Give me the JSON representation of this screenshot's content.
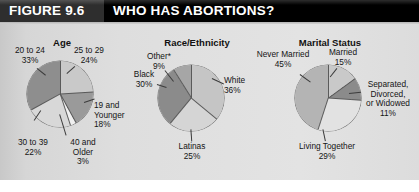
{
  "header": {
    "figure_number": "FIGURE 9.6",
    "title": "WHO HAS ABORTIONS?"
  },
  "chart_data": [
    {
      "type": "pie",
      "title": "Age",
      "categories": [
        "25 to 29",
        "19 and Younger",
        "40 and Older",
        "30 to 39",
        "20 to 24"
      ],
      "values": [
        24,
        18,
        3,
        22,
        33
      ],
      "labels": [
        "25 to 29\n24%",
        "19 and\nYounger\n18%",
        "40 and\nOlder\n3%",
        "30 to 39\n22%",
        "20 to 24\n33%"
      ],
      "colors": [
        "#c9c9c9",
        "#9a9a9a",
        "#f0f0f0",
        "#d8d8d8",
        "#8e8e8e"
      ],
      "legend": "none",
      "start_angle": 0,
      "direction": "clockwise"
    },
    {
      "type": "pie",
      "title": "Race/Ethnicity",
      "categories": [
        "White",
        "Latinas",
        "Black",
        "Other*"
      ],
      "values": [
        36,
        25,
        30,
        9
      ],
      "labels": [
        "White\n36%",
        "Latinas\n25%",
        "Black\n30%",
        "Other*\n9%"
      ],
      "colors": [
        "#c5c5c5",
        "#d5d5d5",
        "#8b8b8b",
        "#a6a6a6"
      ],
      "legend": "none",
      "start_angle": 0,
      "direction": "clockwise"
    },
    {
      "type": "pie",
      "title": "Marital Status",
      "categories": [
        "Married",
        "Separated, Divorced, or Widowed",
        "Living Together",
        "Never Married"
      ],
      "values": [
        15,
        11,
        29,
        45
      ],
      "labels": [
        "Married\n15%",
        "Separated,\nDivorced,\nor Widowed\n11%",
        "Living Together\n29%",
        "Never Married\n45%"
      ],
      "colors": [
        "#c9c9c9",
        "#8b8b8b",
        "#e2e2e2",
        "#b4b4b4"
      ],
      "legend": "none",
      "start_angle": 0,
      "direction": "clockwise"
    }
  ],
  "age_chart": {
    "title": "Age",
    "lbl_20_24_l1": "20 to 24",
    "lbl_20_24_l2": "33%",
    "lbl_25_29_l1": "25 to 29",
    "lbl_25_29_l2": "24%",
    "lbl_19_l1": "19 and",
    "lbl_19_l2": "Younger",
    "lbl_19_l3": "18%",
    "lbl_30_39_l1": "30 to 39",
    "lbl_30_39_l2": "22%",
    "lbl_40_l1": "40 and",
    "lbl_40_l2": "Older",
    "lbl_40_l3": "3%"
  },
  "race_chart": {
    "title": "Race/Ethnicity",
    "lbl_other_l1": "Other*",
    "lbl_other_l2": "9%",
    "lbl_black_l1": "Black",
    "lbl_black_l2": "30%",
    "lbl_white_l1": "White",
    "lbl_white_l2": "36%",
    "lbl_latinas_l1": "Latinas",
    "lbl_latinas_l2": "25%"
  },
  "marital_chart": {
    "title": "Marital Status",
    "lbl_never_l1": "Never Married",
    "lbl_never_l2": "45%",
    "lbl_married_l1": "Married",
    "lbl_married_l2": "15%",
    "lbl_sep_l1": "Separated,",
    "lbl_sep_l2": "Divorced,",
    "lbl_sep_l3": "or Widowed",
    "lbl_sep_l4": "11%",
    "lbl_living_l1": "Living Together",
    "lbl_living_l2": "29%"
  }
}
